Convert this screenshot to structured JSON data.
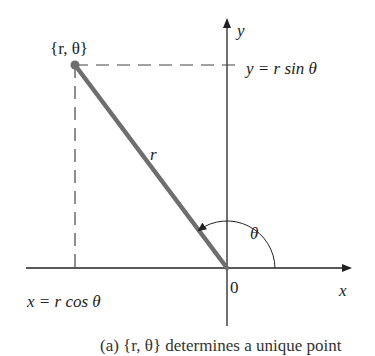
{
  "diagram": {
    "point_label": "{r, θ}",
    "y_axis_label": "y",
    "x_axis_label": "x",
    "origin_label": "0",
    "radius_label": "r",
    "angle_label": "θ",
    "y_projection_label": "y = r sin θ",
    "x_projection_label": "x = r cos θ",
    "caption_partial": "(a) {r, θ} determines a unique point",
    "colors": {
      "radius_line": "#6e6e6e",
      "axes": "#222222",
      "dashes": "#444444"
    }
  }
}
